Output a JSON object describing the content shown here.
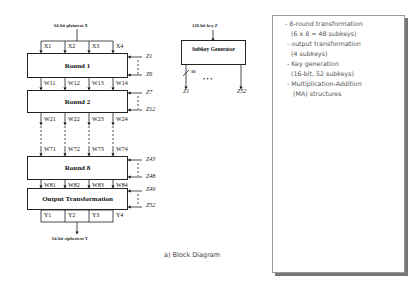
{
  "diagram": {
    "caption": "a) Block Diagram",
    "plaintext_label": "64-bit plaintext X",
    "ciphertext_label": "64-bit ciphertext Y",
    "inputs": [
      "X1",
      "X2",
      "X3",
      "X4"
    ],
    "blocks": [
      {
        "label": "Round 1",
        "outputs": [
          "W11",
          "W12",
          "W13",
          "W14"
        ],
        "subkeys": [
          "Z1",
          "Z6"
        ]
      },
      {
        "label": "Round 2",
        "outputs": [
          "W21",
          "W22",
          "W23",
          "W24"
        ],
        "subkeys": [
          "Z7",
          "Z12"
        ]
      },
      {
        "label": "Round 8",
        "inputs": [
          "W71",
          "W72",
          "W73",
          "W74"
        ],
        "outputs": [
          "W81",
          "W82",
          "W83",
          "W84"
        ],
        "subkeys": [
          "Z43",
          "Z48"
        ]
      },
      {
        "label": "Output Transformation",
        "outputs": [
          "Y1",
          "Y2",
          "Y3",
          "Y4"
        ],
        "subkeys": [
          "Z49",
          "Z52"
        ]
      }
    ],
    "subkey_generator": {
      "key_label": "128-bit key Z",
      "label": "Subkey Generator",
      "bit_width": "16",
      "first_output": "Z1",
      "last_output": "Z52",
      "ellipsis": "• • •"
    }
  },
  "notes": {
    "lines": [
      "- 8-round transformation",
      "(6 x 8 = 48 subkeys)",
      "- output transformation",
      "(4 subkeys)",
      "- Key generation",
      "(16-bit, 52 subkeys)",
      "- Multiplication-Addition",
      "(MA) structures"
    ]
  }
}
